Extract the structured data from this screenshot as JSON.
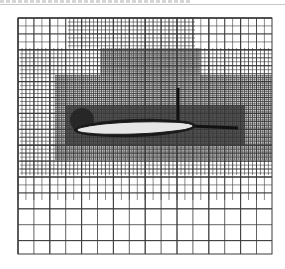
{
  "figure": {
    "type": "adaptive-cartesian-mesh",
    "caption": "",
    "mesh_bounds": {
      "x0": 18,
      "y0": 18,
      "x1": 272,
      "y1": 254
    },
    "base_cell": 15.9,
    "colors": {
      "background": "#ffffff",
      "grid_line": "#3a3a3a",
      "dense_fill": "#7a7a7a",
      "airfoil_fill": "#e6e6e6",
      "airfoil_edge": "#1a1a1a"
    },
    "refinement_zones": [
      {
        "level": 1,
        "x0": 18,
        "y0": 18,
        "x1": 272,
        "y1": 200
      },
      {
        "level": 2,
        "x0": 20,
        "y0": 48,
        "x1": 272,
        "y1": 175
      },
      {
        "level": 2,
        "x0": 68,
        "y0": 18,
        "x1": 195,
        "y1": 48
      },
      {
        "level": 3,
        "x0": 55,
        "y0": 75,
        "x1": 272,
        "y1": 160
      },
      {
        "level": 3,
        "x0": 100,
        "y0": 48,
        "x1": 200,
        "y1": 75
      },
      {
        "level": 4,
        "x0": 65,
        "y0": 105,
        "x1": 245,
        "y1": 145
      }
    ],
    "airfoil": {
      "cx": 135,
      "cy": 128,
      "rx": 58,
      "ry": 6,
      "angle": -2
    },
    "wake": {
      "x0": 190,
      "y0": 126,
      "x1": 238,
      "y1": 128
    },
    "shock": {
      "x": 178,
      "y0": 88,
      "y1": 126
    },
    "dark_blob": {
      "cx": 82,
      "cy": 120,
      "r": 12
    }
  }
}
